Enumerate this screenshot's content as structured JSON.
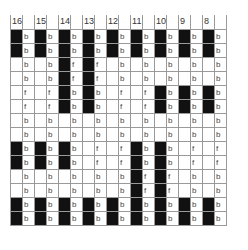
{
  "grid": {
    "columns": [
      "16",
      "15",
      "14",
      "13",
      "12",
      "11",
      "10",
      "9",
      "8"
    ],
    "rows_count": 14,
    "black_rows": {
      "16": [
        1,
        2,
        9,
        10,
        13,
        14
      ],
      "15": [
        1,
        2,
        9,
        10,
        13,
        14
      ],
      "14": [
        1,
        2,
        3,
        4,
        5,
        6,
        9,
        10,
        13,
        14
      ],
      "13": [
        1,
        2,
        3,
        4,
        5,
        6,
        13,
        14
      ],
      "12": [
        1,
        2,
        13,
        14
      ],
      "11": [
        1,
        2,
        9,
        10,
        11,
        12,
        13,
        14
      ],
      "10": [
        1,
        2,
        5,
        6,
        9,
        10,
        11,
        12,
        13,
        14
      ],
      "9": [
        1,
        2,
        5,
        6,
        13,
        14
      ],
      "8": [
        1,
        2,
        5,
        6,
        13,
        14
      ]
    },
    "letters": {
      "16": [
        "b",
        "b",
        "b",
        "b",
        "f",
        "f",
        "b",
        "b",
        "b",
        "b",
        "b",
        "b",
        "b",
        "b"
      ],
      "15": [
        "b",
        "b",
        "b",
        "b",
        "f",
        "f",
        "b",
        "b",
        "b",
        "b",
        "b",
        "b",
        "b",
        "b"
      ],
      "14": [
        "b",
        "b",
        "f",
        "f",
        "b",
        "b",
        "b",
        "b",
        "b",
        "b",
        "b",
        "b",
        "b",
        "b"
      ],
      "13": [
        "b",
        "b",
        "f",
        "f",
        "b",
        "b",
        "b",
        "b",
        "f",
        "f",
        "b",
        "b",
        "b",
        "b"
      ],
      "12": [
        "b",
        "b",
        "b",
        "b",
        "f",
        "f",
        "b",
        "b",
        "f",
        "f",
        "b",
        "b",
        "b",
        "b"
      ],
      "11": [
        "b",
        "b",
        "b",
        "b",
        "f",
        "f",
        "b",
        "b",
        "b",
        "b",
        "f",
        "f",
        "b",
        "b"
      ],
      "10": [
        "b",
        "b",
        "b",
        "b",
        "b",
        "b",
        "b",
        "b",
        "b",
        "b",
        "f",
        "f",
        "b",
        "b"
      ],
      "9": [
        "b",
        "b",
        "b",
        "b",
        "b",
        "b",
        "b",
        "b",
        "f",
        "f",
        "b",
        "b",
        "b",
        "b"
      ],
      "8": [
        "b",
        "b",
        "b",
        "b",
        "b",
        "b",
        "b",
        "b",
        "f",
        "f",
        "b",
        "b",
        "b",
        "b"
      ]
    },
    "colors": {
      "filled": "#111111",
      "line": "#9a9a9a",
      "background": "#ffffff"
    }
  }
}
